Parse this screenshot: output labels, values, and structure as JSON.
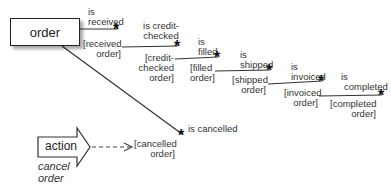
{
  "diagram": {
    "entity": {
      "label": "order"
    },
    "transitions": [
      {
        "event": "is received",
        "event_lines": [
          "is",
          "received"
        ],
        "state": "[received order]",
        "state_lines": [
          "[received",
          "order]"
        ]
      },
      {
        "event": "is credit-checked",
        "event_lines": [
          "is credit-",
          "checked"
        ],
        "state": "[credit-checked order]",
        "state_lines": [
          "[credit-",
          "checked",
          "order]"
        ]
      },
      {
        "event": "is filled",
        "event_lines": [
          "is",
          "filled"
        ],
        "state": "[filled order]",
        "state_lines": [
          "[filled",
          "order]"
        ]
      },
      {
        "event": "is shipped",
        "event_lines": [
          "is",
          "shipped"
        ],
        "state": "[shipped order]",
        "state_lines": [
          "[shipped",
          "order]"
        ]
      },
      {
        "event": "is invoiced",
        "event_lines": [
          "is",
          "invoiced"
        ],
        "state": "[invoiced order]",
        "state_lines": [
          "[invoiced",
          "order]"
        ]
      },
      {
        "event": "is completed",
        "event_lines": [
          "is",
          "completed"
        ],
        "state": "[completed order]",
        "state_lines": [
          "[completed",
          "order]"
        ]
      }
    ],
    "cancel_branch": {
      "event": "is cancelled",
      "state": "[cancelled order]",
      "state_lines": [
        "[cancelled",
        "order]"
      ]
    },
    "action": {
      "label": "action",
      "caption_lines": [
        "cancel",
        "order"
      ]
    },
    "event_marker_glyph": "*"
  }
}
